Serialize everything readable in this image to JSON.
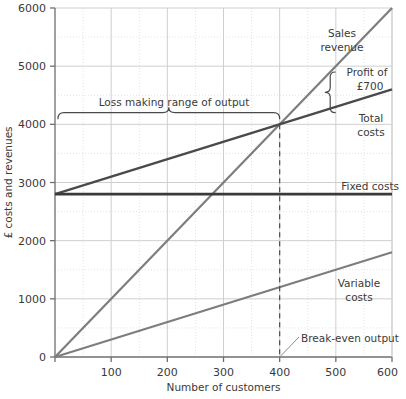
{
  "chart_data": {
    "type": "line",
    "title": "",
    "xlabel": "Number of customers",
    "ylabel": "£ costs and revenues",
    "xlim": [
      0,
      600
    ],
    "ylim": [
      0,
      6000
    ],
    "grid": true,
    "grid_major_x": [
      0,
      100,
      200,
      300,
      400,
      500,
      600
    ],
    "grid_minor_x": [
      50,
      150,
      250,
      350,
      450,
      550
    ],
    "grid_major_y": [
      0,
      1000,
      2000,
      3000,
      4000,
      5000,
      6000
    ],
    "grid_minor_y": [
      500,
      1500,
      2500,
      3500,
      4500,
      5500
    ],
    "xticks": [
      0,
      100,
      200,
      300,
      400,
      500,
      600
    ],
    "xtick_labels": [
      "",
      "100",
      "200",
      "300",
      "400",
      "500",
      "600"
    ],
    "yticks": [
      0,
      1000,
      2000,
      3000,
      4000,
      5000,
      6000
    ],
    "ytick_labels": [
      "0",
      "1000",
      "2000",
      "3000",
      "4000",
      "5000",
      "6000"
    ],
    "legend_position": "inline-right",
    "series": [
      {
        "name": "Sales revenue",
        "color": "#7d7d7d",
        "width": 2.2,
        "x": [
          0,
          600
        ],
        "values": [
          0,
          6000
        ]
      },
      {
        "name": "Total costs",
        "color": "#4a4a4a",
        "width": 2.4,
        "x": [
          0,
          600
        ],
        "values": [
          2800,
          4600
        ]
      },
      {
        "name": "Fixed costs",
        "color": "#3a3a3a",
        "width": 2.6,
        "x": [
          0,
          600
        ],
        "values": [
          2800,
          2800
        ]
      },
      {
        "name": "Variable costs",
        "color": "#7d7d7d",
        "width": 2.2,
        "x": [
          0,
          600
        ],
        "values": [
          0,
          1800
        ]
      }
    ],
    "annotations": {
      "loss_range": {
        "label": "Loss making range of output",
        "from_x": 0,
        "to_x": 400,
        "at_y": 4200
      },
      "profit": {
        "label_line1": "Profit of",
        "label_line2": "£700",
        "at_x": 490,
        "from_y": 4200,
        "to_y": 4900,
        "amount": 700
      },
      "break_even": {
        "label": "Break-even output",
        "x": 400,
        "y": 4000
      }
    },
    "series_labels": {
      "sales_revenue_line1": "Sales",
      "sales_revenue_line2": "revenue",
      "total_costs_line1": "Total",
      "total_costs_line2": "costs",
      "fixed_costs": "Fixed costs",
      "variable_costs_line1": "Variable",
      "variable_costs_line2": "costs"
    },
    "colors": {
      "grid_major": "#cfcfcf",
      "grid_minor": "#e2e2e2",
      "axis": "#6e6e6e",
      "dark_line": "#3a3a3a",
      "mid_line": "#4a4a4a",
      "grey_line": "#7d7d7d",
      "text": "#3a3a3a"
    }
  }
}
